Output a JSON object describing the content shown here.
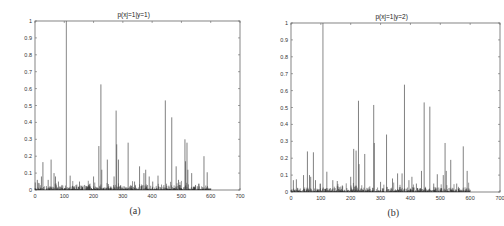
{
  "chart_data": [
    {
      "id": "a",
      "type": "bar",
      "title": "p(xj=1|y=1)",
      "caption": "(a)",
      "xlabel": "",
      "ylabel": "",
      "xlim": [
        0,
        700
      ],
      "ylim": [
        0,
        1
      ],
      "xticks": [
        0,
        100,
        200,
        300,
        400,
        500,
        600,
        700
      ],
      "yticks": [
        0,
        0.1,
        0.2,
        0.3,
        0.4,
        0.5,
        0.6,
        0.7,
        0.8,
        0.9,
        1
      ],
      "ytick_labels": [
        "0",
        "0.1",
        "0.2",
        "0.3",
        "0.4",
        "0.5",
        "0.6",
        "0.7",
        "0.8",
        "0.9",
        "1"
      ],
      "grid": false,
      "num_features": 600,
      "peaks": [
        {
          "x": 8,
          "y": 0.06
        },
        {
          "x": 14,
          "y": 0.04
        },
        {
          "x": 22,
          "y": 0.08
        },
        {
          "x": 27,
          "y": 0.165
        },
        {
          "x": 45,
          "y": 0.06
        },
        {
          "x": 55,
          "y": 0.18
        },
        {
          "x": 65,
          "y": 0.1
        },
        {
          "x": 70,
          "y": 0.08
        },
        {
          "x": 80,
          "y": 0.05
        },
        {
          "x": 92,
          "y": 0.03
        },
        {
          "x": 107,
          "y": 1.0
        },
        {
          "x": 120,
          "y": 0.085
        },
        {
          "x": 140,
          "y": 0.03
        },
        {
          "x": 152,
          "y": 0.05
        },
        {
          "x": 178,
          "y": 0.02
        },
        {
          "x": 200,
          "y": 0.08
        },
        {
          "x": 218,
          "y": 0.26
        },
        {
          "x": 225,
          "y": 0.625
        },
        {
          "x": 228,
          "y": 0.12
        },
        {
          "x": 247,
          "y": 0.18
        },
        {
          "x": 270,
          "y": 0.08
        },
        {
          "x": 277,
          "y": 0.47
        },
        {
          "x": 279,
          "y": 0.27
        },
        {
          "x": 285,
          "y": 0.18
        },
        {
          "x": 318,
          "y": 0.28
        },
        {
          "x": 340,
          "y": 0.05
        },
        {
          "x": 357,
          "y": 0.14
        },
        {
          "x": 372,
          "y": 0.1
        },
        {
          "x": 378,
          "y": 0.12
        },
        {
          "x": 390,
          "y": 0.08
        },
        {
          "x": 402,
          "y": 0.05
        },
        {
          "x": 420,
          "y": 0.085
        },
        {
          "x": 445,
          "y": 0.53
        },
        {
          "x": 467,
          "y": 0.43
        },
        {
          "x": 482,
          "y": 0.14
        },
        {
          "x": 490,
          "y": 0.06
        },
        {
          "x": 512,
          "y": 0.3
        },
        {
          "x": 514,
          "y": 0.17
        },
        {
          "x": 519,
          "y": 0.28
        },
        {
          "x": 522,
          "y": 0.12
        },
        {
          "x": 535,
          "y": 0.1
        },
        {
          "x": 548,
          "y": 0.03
        },
        {
          "x": 577,
          "y": 0.2
        },
        {
          "x": 588,
          "y": 0.105
        }
      ]
    },
    {
      "id": "b",
      "type": "bar",
      "title": "p(xj=1|y=2)",
      "caption": "(b)",
      "xlabel": "",
      "ylabel": "",
      "xlim": [
        0,
        700
      ],
      "ylim": [
        0,
        1
      ],
      "xticks": [
        0,
        100,
        200,
        300,
        400,
        500,
        600,
        700
      ],
      "yticks": [
        0,
        0.1,
        0.2,
        0.3,
        0.4,
        0.5,
        0.6,
        0.7,
        0.8,
        0.9,
        1
      ],
      "ytick_labels": [
        "0",
        "0.1",
        "0.2",
        "0.3",
        "0.4",
        "0.5",
        "0.6",
        "0.7",
        "0.8",
        "0.9",
        "1"
      ],
      "grid": false,
      "num_features": 600,
      "peaks": [
        {
          "x": 8,
          "y": 0.07
        },
        {
          "x": 18,
          "y": 0.075
        },
        {
          "x": 42,
          "y": 0.1
        },
        {
          "x": 55,
          "y": 0.24
        },
        {
          "x": 62,
          "y": 0.1
        },
        {
          "x": 66,
          "y": 0.09
        },
        {
          "x": 75,
          "y": 0.235
        },
        {
          "x": 82,
          "y": 0.07
        },
        {
          "x": 98,
          "y": 0.05
        },
        {
          "x": 107,
          "y": 1.0
        },
        {
          "x": 120,
          "y": 0.12
        },
        {
          "x": 140,
          "y": 0.07
        },
        {
          "x": 155,
          "y": 0.065
        },
        {
          "x": 200,
          "y": 0.09
        },
        {
          "x": 210,
          "y": 0.255
        },
        {
          "x": 218,
          "y": 0.245
        },
        {
          "x": 226,
          "y": 0.54
        },
        {
          "x": 228,
          "y": 0.165
        },
        {
          "x": 247,
          "y": 0.225
        },
        {
          "x": 277,
          "y": 0.515
        },
        {
          "x": 279,
          "y": 0.29
        },
        {
          "x": 300,
          "y": 0.06
        },
        {
          "x": 320,
          "y": 0.34
        },
        {
          "x": 340,
          "y": 0.08
        },
        {
          "x": 357,
          "y": 0.11
        },
        {
          "x": 372,
          "y": 0.11
        },
        {
          "x": 380,
          "y": 0.635
        },
        {
          "x": 395,
          "y": 0.07
        },
        {
          "x": 405,
          "y": 0.09
        },
        {
          "x": 420,
          "y": 0.05
        },
        {
          "x": 437,
          "y": 0.125
        },
        {
          "x": 446,
          "y": 0.53
        },
        {
          "x": 465,
          "y": 0.505
        },
        {
          "x": 478,
          "y": 0.05
        },
        {
          "x": 490,
          "y": 0.105
        },
        {
          "x": 510,
          "y": 0.1
        },
        {
          "x": 516,
          "y": 0.29
        },
        {
          "x": 520,
          "y": 0.125
        },
        {
          "x": 535,
          "y": 0.19
        },
        {
          "x": 555,
          "y": 0.05
        },
        {
          "x": 577,
          "y": 0.27
        },
        {
          "x": 590,
          "y": 0.125
        }
      ]
    }
  ],
  "style": {
    "bar_color": "#4a4a4a",
    "dark_bar_color": "#111111",
    "axis_color": "#666666",
    "text_color": "#333333"
  }
}
